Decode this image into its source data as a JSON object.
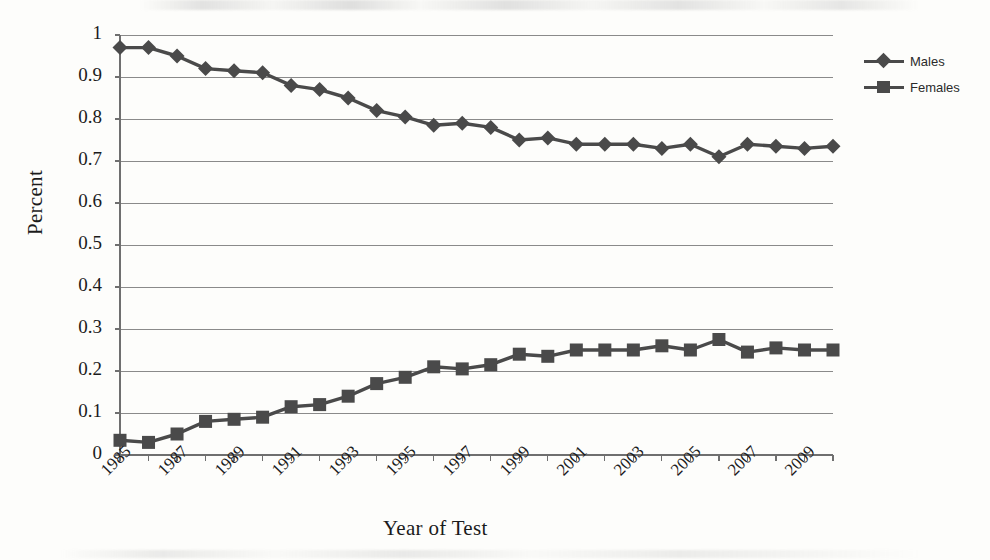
{
  "chart_data": {
    "type": "line",
    "title": "",
    "xlabel": "Year of Test",
    "ylabel": "Percent",
    "xlim": [
      1985,
      2010
    ],
    "ylim": [
      0,
      1
    ],
    "ytick_labels": [
      "1",
      "0.9",
      "0.8",
      "0.7",
      "0.6",
      "0.5",
      "0.4",
      "0.3",
      "0.2",
      "0.1",
      "0"
    ],
    "ytick_values": [
      1,
      0.9,
      0.8,
      0.7,
      0.6,
      0.5,
      0.4,
      0.3,
      0.2,
      0.1,
      0
    ],
    "xtick_labels": [
      "1985",
      "1987",
      "1989",
      "1991",
      "1993",
      "1995",
      "1997",
      "1999",
      "2001",
      "2003",
      "2005",
      "2007",
      "2009"
    ],
    "xtick_values": [
      1985,
      1987,
      1989,
      1991,
      1993,
      1995,
      1997,
      1999,
      2001,
      2003,
      2005,
      2007,
      2009
    ],
    "x": [
      1985,
      1986,
      1987,
      1988,
      1989,
      1990,
      1991,
      1992,
      1993,
      1994,
      1995,
      1996,
      1997,
      1998,
      1999,
      2000,
      2001,
      2002,
      2003,
      2004,
      2005,
      2006,
      2007,
      2008,
      2009,
      2010
    ],
    "grid": "horizontal",
    "legend_position": "right",
    "series": [
      {
        "name": "Males",
        "marker": "diamond",
        "color": "#4a4a4a",
        "values": [
          0.97,
          0.97,
          0.95,
          0.92,
          0.915,
          0.91,
          0.88,
          0.87,
          0.85,
          0.82,
          0.805,
          0.785,
          0.79,
          0.78,
          0.75,
          0.755,
          0.74,
          0.74,
          0.74,
          0.73,
          0.74,
          0.71,
          0.74,
          0.735,
          0.73,
          0.735
        ]
      },
      {
        "name": "Females",
        "marker": "square",
        "color": "#4a4a4a",
        "values": [
          0.035,
          0.03,
          0.05,
          0.08,
          0.085,
          0.09,
          0.115,
          0.12,
          0.14,
          0.17,
          0.185,
          0.21,
          0.205,
          0.215,
          0.24,
          0.235,
          0.25,
          0.25,
          0.25,
          0.26,
          0.25,
          0.275,
          0.245,
          0.255,
          0.25,
          0.25
        ]
      }
    ]
  },
  "legend": {
    "items": [
      {
        "label": "Males"
      },
      {
        "label": "Females"
      }
    ]
  }
}
